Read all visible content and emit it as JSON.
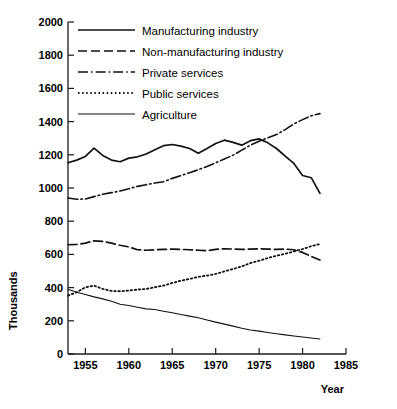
{
  "chart_data": {
    "type": "line",
    "title": "",
    "xlabel": "Year",
    "ylabel": "Thousands",
    "xlim": [
      1953,
      1985
    ],
    "ylim": [
      0,
      2000
    ],
    "grid": false,
    "legend_position": "top-left-inside",
    "xticks": [
      1955,
      1960,
      1965,
      1970,
      1975,
      1980,
      1985
    ],
    "xtick_labels": [
      "1955",
      "1960",
      "1965",
      "1970",
      "1975",
      "1980",
      "1985"
    ],
    "yticks": [
      0,
      200,
      400,
      600,
      800,
      1000,
      1200,
      1400,
      1600,
      1800,
      2000
    ],
    "ytick_labels": [
      "0",
      "200",
      "400",
      "600",
      "800",
      "1000",
      "1200",
      "1400",
      "1600",
      "1800",
      "2000"
    ],
    "series": [
      {
        "name": "Manufacturing industry",
        "style": "solid",
        "x": [
          1953,
          1954,
          1955,
          1956,
          1957,
          1958,
          1959,
          1960,
          1961,
          1962,
          1963,
          1964,
          1965,
          1966,
          1967,
          1968,
          1969,
          1970,
          1971,
          1972,
          1973,
          1974,
          1975,
          1976,
          1977,
          1978,
          1979,
          1980,
          1981,
          1982
        ],
        "values": [
          1152,
          1168,
          1190,
          1240,
          1196,
          1168,
          1158,
          1180,
          1188,
          1205,
          1230,
          1255,
          1262,
          1252,
          1238,
          1210,
          1238,
          1268,
          1288,
          1275,
          1258,
          1285,
          1296,
          1272,
          1238,
          1192,
          1148,
          1075,
          1062,
          968
        ]
      },
      {
        "name": "Non-manufacturing industry",
        "style": "dashed",
        "x": [
          1953,
          1954,
          1955,
          1956,
          1957,
          1958,
          1959,
          1960,
          1961,
          1962,
          1963,
          1964,
          1965,
          1966,
          1967,
          1968,
          1969,
          1970,
          1971,
          1972,
          1973,
          1974,
          1975,
          1976,
          1977,
          1978,
          1979,
          1980,
          1981,
          1982
        ],
        "values": [
          658,
          660,
          668,
          682,
          678,
          668,
          655,
          645,
          628,
          625,
          628,
          630,
          632,
          630,
          628,
          625,
          622,
          630,
          634,
          632,
          630,
          632,
          634,
          632,
          630,
          632,
          628,
          612,
          588,
          566
        ]
      },
      {
        "name": "Private services",
        "style": "dashdot",
        "x": [
          1953,
          1954,
          1955,
          1956,
          1957,
          1958,
          1959,
          1960,
          1961,
          1962,
          1963,
          1964,
          1965,
          1966,
          1967,
          1968,
          1969,
          1970,
          1971,
          1972,
          1973,
          1974,
          1975,
          1976,
          1977,
          1978,
          1979,
          1980,
          1981,
          1982
        ],
        "values": [
          940,
          932,
          934,
          948,
          962,
          972,
          982,
          995,
          1010,
          1020,
          1030,
          1038,
          1058,
          1075,
          1092,
          1110,
          1130,
          1152,
          1175,
          1198,
          1228,
          1258,
          1282,
          1302,
          1322,
          1352,
          1386,
          1412,
          1435,
          1448
        ]
      },
      {
        "name": "Public services",
        "style": "dotted",
        "x": [
          1953,
          1954,
          1955,
          1956,
          1957,
          1958,
          1959,
          1960,
          1961,
          1962,
          1963,
          1964,
          1965,
          1966,
          1967,
          1968,
          1969,
          1970,
          1971,
          1972,
          1973,
          1974,
          1975,
          1976,
          1977,
          1978,
          1979,
          1980,
          1981,
          1982
        ],
        "values": [
          352,
          372,
          402,
          412,
          392,
          380,
          378,
          382,
          388,
          392,
          402,
          412,
          428,
          442,
          452,
          465,
          472,
          482,
          498,
          512,
          528,
          548,
          562,
          578,
          592,
          604,
          618,
          632,
          650,
          662
        ]
      },
      {
        "name": "Agriculture",
        "style": "solid-thin",
        "x": [
          1953,
          1954,
          1955,
          1956,
          1957,
          1958,
          1959,
          1960,
          1961,
          1962,
          1963,
          1964,
          1965,
          1966,
          1967,
          1968,
          1969,
          1970,
          1971,
          1972,
          1973,
          1974,
          1975,
          1976,
          1977,
          1978,
          1979,
          1980,
          1981,
          1982
        ],
        "values": [
          390,
          372,
          358,
          344,
          332,
          318,
          300,
          292,
          282,
          272,
          268,
          258,
          248,
          238,
          228,
          218,
          205,
          192,
          180,
          168,
          155,
          145,
          138,
          130,
          122,
          115,
          108,
          102,
          96,
          90
        ]
      }
    ]
  },
  "legend": {
    "items": [
      {
        "label": "Manufacturing industry",
        "style": "solid"
      },
      {
        "label": "Non-manufacturing industry",
        "style": "dashed"
      },
      {
        "label": "Private services",
        "style": "dashdot"
      },
      {
        "label": "Public services",
        "style": "dotted"
      },
      {
        "label": "Agriculture",
        "style": "solid-thin"
      }
    ]
  }
}
